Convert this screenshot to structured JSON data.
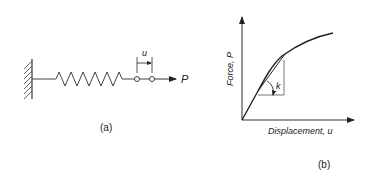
{
  "panel_a": {
    "caption": "(a)",
    "displacement_label": "u",
    "force_label": "P",
    "spring_zigzags": 7
  },
  "panel_b": {
    "caption": "(b)",
    "y_axis_label": "Force, P",
    "x_axis_label": "Displacement, u",
    "slope_label": "k"
  },
  "colors": {
    "line": "#333333",
    "background": "#ffffff"
  }
}
